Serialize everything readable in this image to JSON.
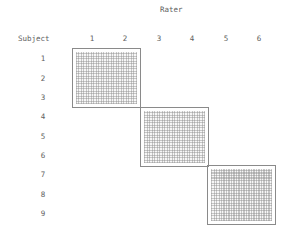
{
  "header": {
    "rater_label": "Rater",
    "subject_label": "Subject"
  },
  "raters": [
    "1",
    "2",
    "3",
    "4",
    "5",
    "6"
  ],
  "subjects": [
    "1",
    "2",
    "3",
    "4",
    "5",
    "6",
    "7",
    "8",
    "9"
  ],
  "blocks": [
    {
      "raters": [
        "1",
        "2"
      ],
      "subjects": [
        "1",
        "2",
        "3"
      ]
    },
    {
      "raters": [
        "3",
        "4"
      ],
      "subjects": [
        "4",
        "5",
        "6"
      ]
    },
    {
      "raters": [
        "5",
        "6"
      ],
      "subjects": [
        "7",
        "8",
        "9"
      ]
    }
  ],
  "colors": {
    "border": "#8a8a8a",
    "hatch": "#8c8c8c",
    "text": "#5e5e5e"
  }
}
